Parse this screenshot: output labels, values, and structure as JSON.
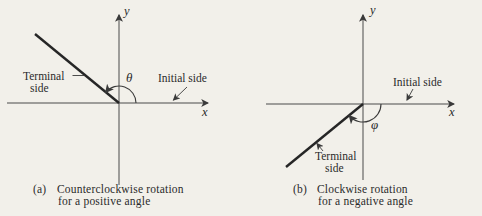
{
  "figure": {
    "background_color": "#f2f0ea",
    "ink_color": "#2b2b2b",
    "panels": [
      {
        "id": "a",
        "y_axis_label": "y",
        "x_axis_label": "x",
        "angle_symbol": "θ",
        "terminal_label_line1": "Terminal",
        "terminal_label_line2": "side",
        "initial_side_label": "Initial side",
        "caption_prefix": "(a)",
        "caption_line1": "Counterclockwise rotation",
        "caption_line2": "for a positive angle",
        "rotation_direction": "counterclockwise",
        "angle_sign": "positive",
        "terminal_angle_deg": 141
      },
      {
        "id": "b",
        "y_axis_label": "y",
        "x_axis_label": "x",
        "angle_symbol": "φ",
        "terminal_label_line1": "Terminal",
        "terminal_label_line2": "side",
        "initial_side_label": "Initial side",
        "caption_prefix": "(b)",
        "caption_line1": "Clockwise rotation",
        "caption_line2": "for a negative angle",
        "rotation_direction": "clockwise",
        "angle_sign": "negative",
        "terminal_angle_deg": -141
      }
    ]
  }
}
